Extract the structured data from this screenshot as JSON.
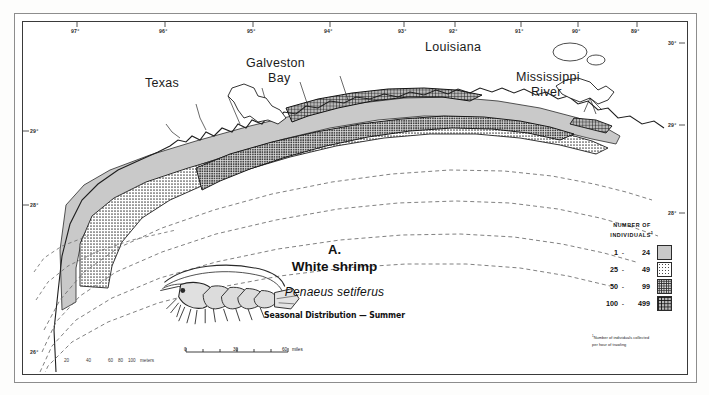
{
  "figure": {
    "panel_letter": "A.",
    "common_name": "White shrimp",
    "scientific_name": "Penaeus setiferus",
    "subtitle": "Seasonal Distribution — Summer"
  },
  "places": [
    {
      "name": "Texas",
      "x": 145,
      "y": 76
    },
    {
      "name": "Galveston",
      "x": 246,
      "y": 56
    },
    {
      "name": "Bay",
      "x": 268,
      "y": 71
    },
    {
      "name": "Louisiana",
      "x": 425,
      "y": 40
    },
    {
      "name": "Mississippi",
      "x": 516,
      "y": 70
    },
    {
      "name": "River",
      "x": 531,
      "y": 85
    }
  ],
  "legend": {
    "title_line1": "NUMBER OF",
    "title_line2": "INDIVIDUALS",
    "title_marker": "1",
    "classes": [
      {
        "low": "1",
        "dash": "-",
        "high": "24",
        "pattern": "light-gray"
      },
      {
        "low": "25",
        "dash": "-",
        "high": "49",
        "pattern": "medium-stipple"
      },
      {
        "low": "50",
        "dash": "-",
        "high": "99",
        "pattern": "dense-stipple"
      },
      {
        "low": "100",
        "dash": "-",
        "high": "499",
        "pattern": "cross-hatch"
      }
    ],
    "footnote_marker": "1",
    "footnote_line1": "Number of individuals collected",
    "footnote_line2": "per hour of trawling"
  },
  "scale": {
    "ticks": [
      "0",
      "30",
      "60"
    ],
    "units": "miles"
  },
  "axes": {
    "longitude_top": [
      {
        "label": "97°",
        "x": 77
      },
      {
        "label": "96°",
        "x": 165
      },
      {
        "label": "95°",
        "x": 253
      },
      {
        "label": "94°",
        "x": 330
      },
      {
        "label": "93°",
        "x": 404
      },
      {
        "label": "92°",
        "x": 455
      },
      {
        "label": "91°",
        "x": 521
      },
      {
        "label": "90°",
        "x": 578
      },
      {
        "label": "89°",
        "x": 637
      }
    ],
    "latitude_left": [
      {
        "label": "29°",
        "y": 131
      },
      {
        "label": "28°",
        "y": 205
      },
      {
        "label": "26°",
        "y": 352
      }
    ],
    "latitude_right": [
      {
        "label": "30°",
        "y": 43
      },
      {
        "label": "29°",
        "y": 125
      },
      {
        "label": "28°",
        "y": 213
      }
    ]
  },
  "depth_contours": {
    "labels": [
      "20",
      "40",
      "60",
      "80",
      "100"
    ],
    "units": "meters"
  }
}
